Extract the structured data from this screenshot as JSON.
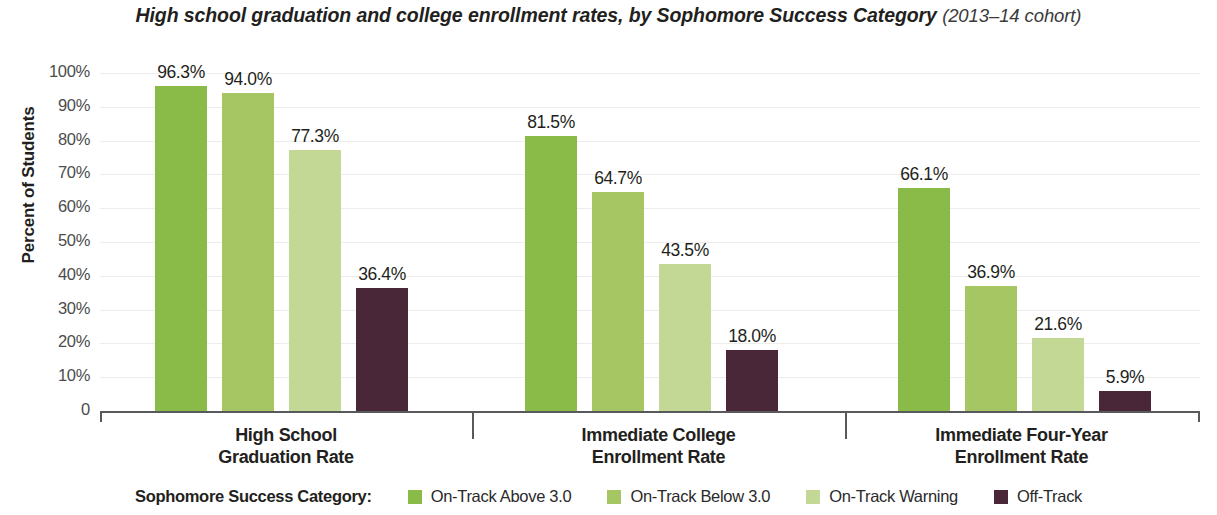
{
  "chart_data": {
    "type": "bar",
    "title": "High school graduation and college enrollment rates, by Sophomore Success Category",
    "subtitle": "(2013–14 cohort)",
    "xlabel": "",
    "ylabel": "Percent of Students",
    "ylim": [
      0,
      100
    ],
    "yticks": [
      "0",
      "10%",
      "20%",
      "30%",
      "40%",
      "50%",
      "60%",
      "70%",
      "80%",
      "90%",
      "100%"
    ],
    "grid": true,
    "legend_position": "bottom",
    "legend_title": "Sophomore Success Category:",
    "categories": [
      "High School\nGraduation Rate",
      "Immediate College\nEnrollment Rate",
      "Immediate Four-Year\nEnrollment Rate"
    ],
    "category_lines": [
      [
        "High School",
        "Graduation Rate"
      ],
      [
        "Immediate College",
        "Enrollment Rate"
      ],
      [
        "Immediate Four-Year",
        "Enrollment Rate"
      ]
    ],
    "series": [
      {
        "name": "On-Track Above 3.0",
        "color": "#8aba48",
        "values": [
          96.3,
          81.5,
          66.1
        ],
        "labels": [
          "96.3%",
          "81.5%",
          "66.1%"
        ]
      },
      {
        "name": "On-Track Below 3.0",
        "color": "#a6c664",
        "values": [
          94.0,
          64.7,
          36.9
        ],
        "labels": [
          "94.0%",
          "64.7%",
          "36.9%"
        ]
      },
      {
        "name": "On-Track Warning",
        "color": "#c3d894",
        "values": [
          77.3,
          43.5,
          21.6
        ],
        "labels": [
          "77.3%",
          "43.5%",
          "21.6%"
        ]
      },
      {
        "name": "Off-Track",
        "color": "#4a2738",
        "values": [
          36.4,
          18.0,
          5.9
        ],
        "labels": [
          "36.4%",
          "18.0%",
          "5.9%"
        ]
      }
    ]
  }
}
